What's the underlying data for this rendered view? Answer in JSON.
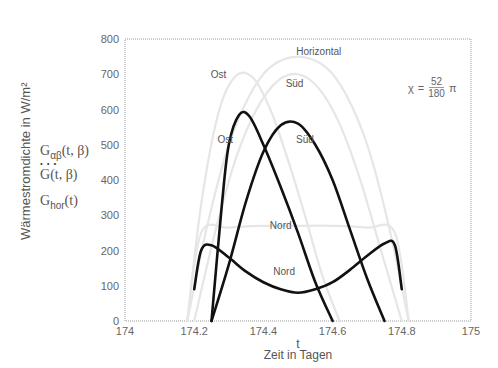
{
  "chart_data": {
    "type": "line",
    "title": "",
    "xlabel_symbol": "t",
    "xlabel": "Zeit in Tagen",
    "ylabel": "Wärmestromdichte in W/m²",
    "xlim": [
      174,
      175
    ],
    "ylim": [
      0,
      800
    ],
    "x_ticks": [
      "174",
      "174.2",
      "174.4",
      "174.6",
      "174.8",
      "175"
    ],
    "y_ticks": [
      "0",
      "100",
      "200",
      "300",
      "400",
      "500",
      "600",
      "700",
      "800"
    ],
    "grid": false,
    "legend": {
      "position": "left of y-axis",
      "entries": [
        {
          "id": "g_alpha_beta",
          "label": "Gαβ(t, β)"
        },
        {
          "id": "g_dot",
          "label": "Ġ(t, β)"
        },
        {
          "id": "g_hor",
          "label": "Ghor(t)"
        }
      ]
    },
    "annotation": {
      "formula": "χ = 52/180 · π",
      "lhs": "χ",
      "eq": "=",
      "num": "52",
      "den": "180",
      "rhs": "π"
    },
    "series": [
      {
        "name": "Ost (dark)",
        "style": "dark",
        "label": "Ost",
        "x": [
          174.25,
          174.28,
          174.3,
          174.33,
          174.36,
          174.4,
          174.45,
          174.5,
          174.55,
          174.6
        ],
        "values": [
          0,
          330,
          500,
          585,
          580,
          500,
          380,
          250,
          110,
          0
        ]
      },
      {
        "name": "Süd (dark)",
        "style": "dark",
        "label": "Süd",
        "x": [
          174.25,
          174.3,
          174.35,
          174.4,
          174.45,
          174.5,
          174.55,
          174.6,
          174.65,
          174.7,
          174.75
        ],
        "values": [
          0,
          160,
          340,
          480,
          555,
          560,
          500,
          400,
          260,
          120,
          0
        ]
      },
      {
        "name": "Nord (dark)",
        "style": "dark",
        "label": "Nord",
        "x": [
          174.2,
          174.22,
          174.25,
          174.3,
          174.35,
          174.4,
          174.45,
          174.5,
          174.55,
          174.6,
          174.65,
          174.7,
          174.75,
          174.78,
          174.8
        ],
        "values": [
          90,
          200,
          215,
          180,
          140,
          110,
          90,
          80,
          90,
          110,
          145,
          185,
          220,
          215,
          90
        ]
      },
      {
        "name": "Ost (light)",
        "style": "light",
        "label": "Ost",
        "x": [
          174.18,
          174.22,
          174.27,
          174.32,
          174.37,
          174.42,
          174.47,
          174.52,
          174.57,
          174.62
        ],
        "values": [
          0,
          330,
          590,
          695,
          690,
          600,
          460,
          300,
          130,
          0
        ]
      },
      {
        "name": "Süd (light)",
        "style": "light",
        "label": "Süd",
        "x": [
          174.2,
          174.26,
          174.32,
          174.38,
          174.44,
          174.5,
          174.56,
          174.62,
          174.68,
          174.74,
          174.8
        ],
        "values": [
          0,
          250,
          460,
          600,
          680,
          700,
          660,
          560,
          400,
          200,
          0
        ]
      },
      {
        "name": "Horizontal (light)",
        "style": "light",
        "label": "Horizontal",
        "x": [
          174.18,
          174.24,
          174.3,
          174.36,
          174.42,
          174.5,
          174.58,
          174.64,
          174.7,
          174.76,
          174.82
        ],
        "values": [
          0,
          280,
          500,
          640,
          720,
          750,
          720,
          640,
          500,
          280,
          0
        ]
      },
      {
        "name": "Nord (light)",
        "style": "light",
        "label": "Nord",
        "x": [
          174.18,
          174.22,
          174.3,
          174.4,
          174.5,
          174.6,
          174.7,
          174.78,
          174.82
        ],
        "values": [
          0,
          250,
          265,
          270,
          270,
          270,
          265,
          250,
          0
        ]
      }
    ],
    "labels": [
      {
        "text": "Ost",
        "x": 174.27,
        "y": 690,
        "style": "light"
      },
      {
        "text": "Süd",
        "x": 174.49,
        "y": 665,
        "style": "light"
      },
      {
        "text": "Horizontal",
        "x": 174.56,
        "y": 755,
        "style": "light"
      },
      {
        "text": "Ost",
        "x": 174.29,
        "y": 505,
        "style": "dark"
      },
      {
        "text": "Süd",
        "x": 174.52,
        "y": 505,
        "style": "dark"
      },
      {
        "text": "Nord",
        "x": 174.45,
        "y": 260,
        "style": "dark"
      },
      {
        "text": "Nord",
        "x": 174.46,
        "y": 130,
        "style": "dark"
      }
    ]
  },
  "legend_text": {
    "g1_main": "G",
    "g1_sub": "αβ",
    "g1_args": "(t, β)",
    "g2_main": "G",
    "g2_args": "(t, β)",
    "g2_dots": "•   •   •",
    "g3_main": "G",
    "g3_sub": "hor",
    "g3_args": "(t)"
  }
}
